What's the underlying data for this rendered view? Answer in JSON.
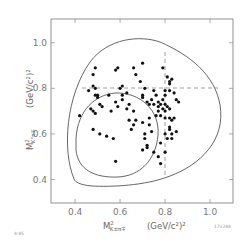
{
  "chart_data": {
    "type": "scatter",
    "title": "",
    "xlabel": "M²(K±π∓) (GeV/c²)²",
    "ylabel": "M²(K°π∓) (GeV/c²)²",
    "xlim": [
      0.293,
      1.102
    ],
    "ylim": [
      0.297,
      1.104
    ],
    "x_ticks": [
      0.4,
      0.6,
      0.8,
      1.0
    ],
    "y_ticks": [
      0.4,
      0.6,
      0.8,
      1.0
    ],
    "x_tick_labels": [
      "0.4",
      "0.6",
      "0.8",
      "1.0"
    ],
    "y_tick_labels": [
      "0.4",
      "0.6",
      "0.8",
      "1.0"
    ],
    "grid": false,
    "legend": null,
    "reference_lines": [
      {
        "orientation": "horizontal",
        "value": 0.8,
        "style": "dashed"
      },
      {
        "orientation": "vertical",
        "value": 0.8,
        "style": "dashed"
      }
    ],
    "boundaries": [
      "outer Dalitz kinematic boundary",
      "inner Dalitz kinematic boundary"
    ],
    "points": [
      [
        0.42,
        0.68
      ],
      [
        0.46,
        0.79
      ],
      [
        0.48,
        0.81
      ],
      [
        0.49,
        0.8
      ],
      [
        0.48,
        0.86
      ],
      [
        0.49,
        0.89
      ],
      [
        0.49,
        0.77
      ],
      [
        0.5,
        0.77
      ],
      [
        0.5,
        0.76
      ],
      [
        0.47,
        0.71
      ],
      [
        0.48,
        0.7
      ],
      [
        0.49,
        0.69
      ],
      [
        0.51,
        0.73
      ],
      [
        0.58,
        0.88
      ],
      [
        0.59,
        0.89
      ],
      [
        0.6,
        0.8
      ],
      [
        0.61,
        0.81
      ],
      [
        0.58,
        0.74
      ],
      [
        0.59,
        0.72
      ],
      [
        0.61,
        0.77
      ],
      [
        0.63,
        0.78
      ],
      [
        0.63,
        0.71
      ],
      [
        0.64,
        0.73
      ],
      [
        0.66,
        0.89
      ],
      [
        0.67,
        0.86
      ],
      [
        0.7,
        0.91
      ],
      [
        0.69,
        0.83
      ],
      [
        0.7,
        0.77
      ],
      [
        0.7,
        0.76
      ],
      [
        0.71,
        0.8
      ],
      [
        0.72,
        0.74
      ],
      [
        0.73,
        0.73
      ],
      [
        0.74,
        0.75
      ],
      [
        0.75,
        0.79
      ],
      [
        0.75,
        0.73
      ],
      [
        0.76,
        0.77
      ],
      [
        0.77,
        0.74
      ],
      [
        0.77,
        0.72
      ],
      [
        0.77,
        0.7
      ],
      [
        0.76,
        0.68
      ],
      [
        0.78,
        0.68
      ],
      [
        0.79,
        0.89
      ],
      [
        0.81,
        0.85
      ],
      [
        0.82,
        0.83
      ],
      [
        0.82,
        0.82
      ],
      [
        0.83,
        0.84
      ],
      [
        0.8,
        0.79
      ],
      [
        0.82,
        0.79
      ],
      [
        0.84,
        0.78
      ],
      [
        0.85,
        0.75
      ],
      [
        0.86,
        0.74
      ],
      [
        0.8,
        0.77
      ],
      [
        0.79,
        0.75
      ],
      [
        0.78,
        0.73
      ],
      [
        0.8,
        0.73
      ],
      [
        0.81,
        0.72
      ],
      [
        0.79,
        0.71
      ],
      [
        0.82,
        0.71
      ],
      [
        0.8,
        0.7
      ],
      [
        0.8,
        0.67
      ],
      [
        0.82,
        0.67
      ],
      [
        0.83,
        0.66
      ],
      [
        0.84,
        0.67
      ],
      [
        0.82,
        0.62
      ],
      [
        0.83,
        0.6
      ],
      [
        0.85,
        0.61
      ],
      [
        0.81,
        0.58
      ],
      [
        0.83,
        0.58
      ],
      [
        0.82,
        0.63
      ],
      [
        0.8,
        0.6
      ],
      [
        0.66,
        0.7
      ],
      [
        0.67,
        0.66
      ],
      [
        0.7,
        0.65
      ],
      [
        0.73,
        0.64
      ],
      [
        0.74,
        0.61
      ],
      [
        0.71,
        0.6
      ],
      [
        0.66,
        0.64
      ],
      [
        0.64,
        0.66
      ],
      [
        0.73,
        0.67
      ],
      [
        0.48,
        0.62
      ],
      [
        0.51,
        0.6
      ],
      [
        0.54,
        0.59
      ],
      [
        0.57,
        0.58
      ],
      [
        0.58,
        0.48
      ],
      [
        0.52,
        0.72
      ],
      [
        0.71,
        0.58
      ],
      [
        0.72,
        0.55
      ],
      [
        0.72,
        0.54
      ],
      [
        0.75,
        0.52
      ],
      [
        0.77,
        0.5
      ],
      [
        0.78,
        0.47
      ],
      [
        0.7,
        0.53
      ],
      [
        0.78,
        0.56
      ],
      [
        0.8,
        0.52
      ],
      [
        0.65,
        0.62
      ],
      [
        0.61,
        0.75
      ],
      [
        0.55,
        0.77
      ],
      [
        0.56,
        0.7
      ]
    ]
  },
  "labels": {
    "x_axis_main": "M",
    "x_axis_sup": "2",
    "x_axis_sub": "K±π∓",
    "x_axis_units": "(GeV/c²)²",
    "y_axis_main": "M",
    "y_axis_sup": "2",
    "y_axis_sub": "K°π∓",
    "y_axis_units": "(GeV/c²)²",
    "corner_left": "4-85",
    "corner_right": "17x244"
  }
}
